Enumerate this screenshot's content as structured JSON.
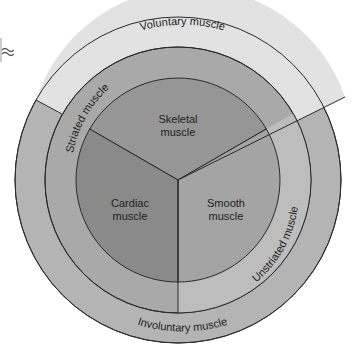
{
  "diagram": {
    "center": {
      "x": 178,
      "y": 180
    },
    "radii": {
      "outer": 163,
      "middle": 133,
      "inner": 102
    },
    "colors": {
      "background": "#ffffff",
      "voluntary": "#e2e2e2",
      "involuntary": "#b4b4b4",
      "striated": "#a9a9a9",
      "unstriated": "#bdbdbd",
      "skeletal": "#969696",
      "cardiac": "#8a8a8a",
      "smooth": "#a4a4a4",
      "stroke": "#2a2a2a"
    },
    "outer_ring": {
      "voluntary_label": "Voluntary muscle",
      "involuntary_label": "Involuntary muscle"
    },
    "middle_ring": {
      "striated_label": "Striated muscle",
      "unstriated_label": "Unstriated muscle"
    },
    "inner_sectors": {
      "skeletal": {
        "line1": "Skeletal",
        "line2": "muscle"
      },
      "cardiac": {
        "line1": "Cardiac",
        "line2": "muscle"
      },
      "smooth": {
        "line1": "Smooth",
        "line2": "muscle"
      }
    }
  }
}
